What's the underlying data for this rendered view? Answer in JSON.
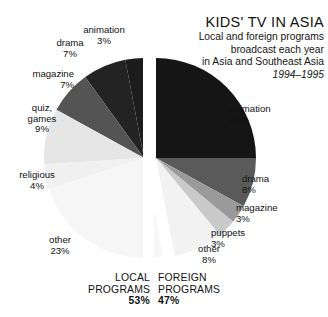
{
  "title": {
    "main": "KIDS' TV IN ASIA",
    "line1": "Local and foreign programs",
    "line2": "broadcast each year",
    "line3": "in Asia and Southeast Asia",
    "date": "1994–1995"
  },
  "summary": {
    "local": {
      "line1": "LOCAL",
      "line2": "PROGRAMS",
      "percent": "53%"
    },
    "foreign": {
      "line1": "FOREIGN",
      "line2": "PROGRAMS",
      "percent": "47%"
    }
  },
  "labels": {
    "local": {
      "animation": {
        "name": "animation",
        "percent": "3%"
      },
      "drama": {
        "name": "drama",
        "percent": "7%"
      },
      "magazine": {
        "name": "magazine",
        "percent": "7%"
      },
      "quiz": {
        "name1": "quiz,",
        "name2": "games",
        "percent": "9%"
      },
      "religious": {
        "name": "religious",
        "percent": "4%"
      },
      "other": {
        "name": "other",
        "percent": "23%"
      }
    },
    "foreign": {
      "animation": {
        "name": "animation",
        "percent": "25%"
      },
      "drama": {
        "name": "drama",
        "percent": "8%"
      },
      "magazine": {
        "name": "magazine",
        "percent": "3%"
      },
      "puppets": {
        "name": "puppets",
        "percent": "3%"
      },
      "other": {
        "name": "other",
        "percent": "8%"
      }
    }
  },
  "colors": {
    "background": "#ffffff",
    "text": "#111111",
    "animation_dark": "#1c1c1c",
    "drama_dark": "#232323",
    "magazine_mid": "#545454",
    "quiz_light": "#e6e6e6",
    "religious_light": "#f0f0f0",
    "other_light": "#f6f6f6",
    "foreign_animation": "#151515",
    "foreign_drama": "#5a5a5a",
    "foreign_magazine": "#9a9a9a",
    "foreign_puppets": "#c9c9c9",
    "foreign_other": "#f2f2f2",
    "split_gap": "#ffffff"
  },
  "chart_data": {
    "type": "pie",
    "title": "KIDS' TV IN ASIA",
    "subtitle": "Local and foreign programs broadcast each year in Asia and Southeast Asia",
    "period": "1994–1995",
    "note": "Single pie split vertically: left half = local programs (53% total), right half = foreign programs (47% total). Slice percentages are shares of the whole pie.",
    "grid": false,
    "legend": "none (direct slice labels)",
    "groups": [
      {
        "name": "LOCAL PROGRAMS",
        "total": 53,
        "side": "left",
        "slices": [
          {
            "label": "animation",
            "value": 3,
            "color": "#1c1c1c"
          },
          {
            "label": "drama",
            "value": 7,
            "color": "#232323"
          },
          {
            "label": "magazine",
            "value": 7,
            "color": "#545454"
          },
          {
            "label": "quiz, games",
            "value": 9,
            "color": "#e6e6e6"
          },
          {
            "label": "religious",
            "value": 4,
            "color": "#f0f0f0"
          },
          {
            "label": "other",
            "value": 23,
            "color": "#f6f6f6"
          }
        ]
      },
      {
        "name": "FOREIGN PROGRAMS",
        "total": 47,
        "side": "right",
        "slices": [
          {
            "label": "animation",
            "value": 25,
            "color": "#151515"
          },
          {
            "label": "drama",
            "value": 8,
            "color": "#5a5a5a"
          },
          {
            "label": "magazine",
            "value": 3,
            "color": "#9a9a9a"
          },
          {
            "label": "puppets",
            "value": 3,
            "color": "#c9c9c9"
          },
          {
            "label": "other",
            "value": 8,
            "color": "#f2f2f2"
          }
        ]
      }
    ],
    "categories": [
      "animation",
      "drama",
      "magazine",
      "quiz, games",
      "religious",
      "other",
      "animation",
      "drama",
      "magazine",
      "puppets",
      "other"
    ],
    "values": [
      3,
      7,
      7,
      9,
      4,
      23,
      25,
      8,
      3,
      3,
      8
    ]
  }
}
